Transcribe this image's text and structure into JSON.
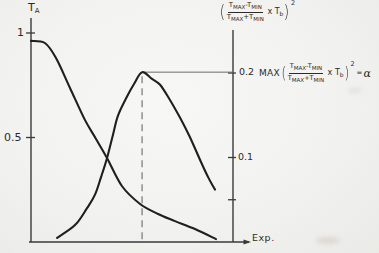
{
  "colors": {
    "background": "#f2f2f0",
    "curve": "#1f1f1f",
    "axis": "#3a3a3a",
    "dashed_guide": "#8f8f8d",
    "horizontal_guide": "#6a6a68",
    "text": "#2b2b2b"
  },
  "labels": {
    "left_axis_title_main": "T",
    "left_axis_title_sub": "A",
    "left_tick_1": "1",
    "left_tick_05": "0.5",
    "right_tick_02": "0.2",
    "right_tick_01": "0.1",
    "x_axis_label": "Exp."
  },
  "formula": {
    "open_paren": "(",
    "close_paren": ")",
    "t": "T",
    "sub_max": "MAX",
    "sub_min": "MIN",
    "minus": "-",
    "plus": "+",
    "times": "x",
    "t_b_main": "T",
    "t_b_sub": "b",
    "squared": "2",
    "max_fn": "MAX",
    "equals": "=",
    "alpha": "α"
  },
  "chart_data": {
    "type": "line",
    "title": "",
    "xlabel": "Exp.",
    "x_range": [
      0,
      1
    ],
    "grid": false,
    "left_axis": {
      "label": "T_A",
      "range": [
        0,
        1.05
      ],
      "ticks": [
        1,
        0.5
      ],
      "tick_labels": [
        "1",
        "0.5"
      ]
    },
    "right_axis": {
      "label": "((T_MAX - T_MIN)/(T_MAX + T_MIN) x T_b)^2",
      "range": [
        0,
        0.25
      ],
      "ticks": [
        0.2,
        0.1,
        0.05
      ],
      "tick_labels": [
        "0.2",
        "0.1",
        ""
      ]
    },
    "annotation": "MAX((T_MAX - T_MIN)/(T_MAX + T_MIN) x T_b)^2 = α occurs at 0.2",
    "peak": {
      "x": 0.55,
      "value": 0.2
    },
    "series": [
      {
        "name": "T_A",
        "axis": "left",
        "points": [
          [
            0.0,
            0.962
          ],
          [
            0.069,
            0.952
          ],
          [
            0.124,
            0.88
          ],
          [
            0.193,
            0.737
          ],
          [
            0.267,
            0.584
          ],
          [
            0.322,
            0.493
          ],
          [
            0.376,
            0.402
          ],
          [
            0.45,
            0.268
          ],
          [
            0.54,
            0.182
          ],
          [
            0.629,
            0.134
          ],
          [
            0.713,
            0.1
          ],
          [
            0.812,
            0.062
          ],
          [
            0.916,
            0.014
          ]
        ]
      },
      {
        "name": "((T_MAX - T_MIN)/(T_MAX + T_MIN) x T_b)^2",
        "axis": "right",
        "points": [
          [
            0.129,
            0.005
          ],
          [
            0.218,
            0.02
          ],
          [
            0.277,
            0.04
          ],
          [
            0.317,
            0.056
          ],
          [
            0.347,
            0.077
          ],
          [
            0.376,
            0.099
          ],
          [
            0.406,
            0.127
          ],
          [
            0.431,
            0.15
          ],
          [
            0.475,
            0.172
          ],
          [
            0.51,
            0.187
          ],
          [
            0.55,
            0.201
          ],
          [
            0.599,
            0.193
          ],
          [
            0.639,
            0.186
          ],
          [
            0.688,
            0.168
          ],
          [
            0.738,
            0.147
          ],
          [
            0.787,
            0.124
          ],
          [
            0.837,
            0.097
          ],
          [
            0.876,
            0.077
          ],
          [
            0.911,
            0.062
          ]
        ]
      }
    ]
  }
}
